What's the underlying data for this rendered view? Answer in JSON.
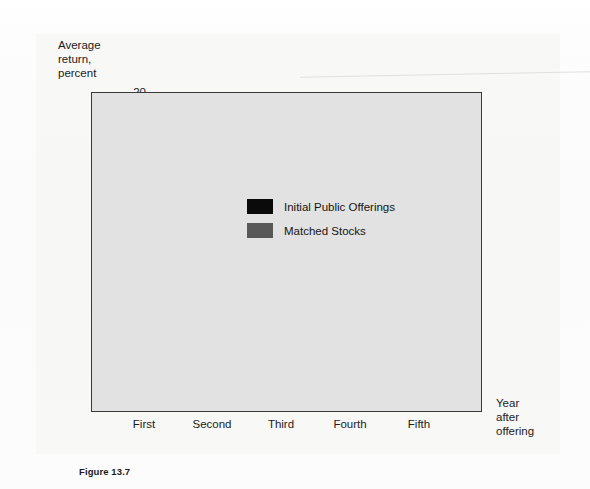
{
  "figure": {
    "caption": "Figure 13.7"
  },
  "chart_data": {
    "type": "bar",
    "title": "",
    "subtitle": "",
    "categories": [
      "First",
      "Second",
      "Third",
      "Fourth",
      "Fifth"
    ],
    "series": [
      {
        "name": "Initial Public Offerings",
        "color": "#0a0a0a",
        "values": [
          1.7,
          3.8,
          5.0,
          4.0,
          11.6
        ]
      },
      {
        "name": "Matched Stocks",
        "color": "#585858",
        "values": [
          6.1,
          14.2,
          13.3,
          11.3,
          14.3
        ]
      }
    ],
    "ylabel": "Average return, percent",
    "ylabel_lines": [
      "Average",
      "return,",
      "percent"
    ],
    "xlabel": "Year after offering",
    "xlabel_lines": [
      "Year",
      "after",
      "offering"
    ],
    "ylim": [
      0,
      20
    ],
    "yticks": [
      20,
      15,
      10,
      5
    ],
    "ytick_labels": [
      "20",
      "15",
      "10",
      "5"
    ],
    "grid": false,
    "legend_position": "inside-top-left",
    "plot_background": "#e2e2e2",
    "frame_color": "#3a3a3a"
  }
}
